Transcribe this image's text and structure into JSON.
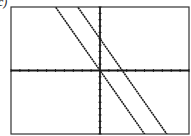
{
  "label": "c)",
  "chart_data": {
    "type": "line",
    "title": "",
    "xlabel": "",
    "ylabel": "",
    "xlim": [
      -10,
      10
    ],
    "ylim": [
      -10,
      10
    ],
    "xtick_step": 1,
    "ytick_step": 1,
    "grid": false,
    "series": [
      {
        "name": "line1",
        "slope": -2,
        "intercept": 0
      },
      {
        "name": "line2",
        "slope": -2,
        "intercept": 5
      }
    ],
    "colors": {
      "line": "#1a1a1a",
      "frame": "#333333",
      "bg": "#ffffff"
    }
  }
}
